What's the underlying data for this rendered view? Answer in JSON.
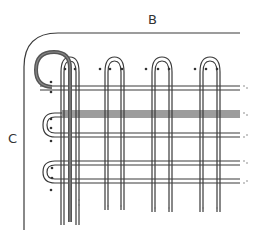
{
  "diagram": {
    "labels": {
      "top": "B",
      "left": "C"
    },
    "colors": {
      "line": "#3a3a3a",
      "thick_strand": "#555555",
      "background": "#ffffff"
    },
    "vertical_loops": [
      {
        "x_left": 61,
        "x_right": 79,
        "top": 62
      },
      {
        "x_left": 105,
        "x_right": 124,
        "top": 62
      },
      {
        "x_left": 152,
        "x_right": 172,
        "top": 62
      },
      {
        "x_left": 200,
        "x_right": 220,
        "top": 62
      }
    ],
    "horizontal_rows": [
      {
        "y_top": 121,
        "y_bottom": 136,
        "loop_left": 43
      },
      {
        "y_top": 165,
        "y_bottom": 184,
        "loop_left": 43
      }
    ],
    "top_strand_y": 88
  }
}
